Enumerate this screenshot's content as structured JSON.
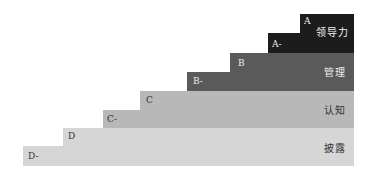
{
  "diagram": {
    "type": "staircase",
    "tiers": [
      {
        "id": "A",
        "name": "领导力",
        "upper_label": "A",
        "lower_label": "A-",
        "color": "#1c1c1c",
        "text_color": "#f2f2f2"
      },
      {
        "id": "B",
        "name": "管理",
        "upper_label": "B",
        "lower_label": "B-",
        "color": "#5a5a5a",
        "text_color": "#eeeeee"
      },
      {
        "id": "C",
        "name": "认知",
        "upper_label": "C",
        "lower_label": "C-",
        "color": "#b8b8b8",
        "text_color": "#333333"
      },
      {
        "id": "D",
        "name": "披露",
        "upper_label": "D",
        "lower_label": "D-",
        "color": "#d6d6d6",
        "text_color": "#333333"
      }
    ]
  }
}
